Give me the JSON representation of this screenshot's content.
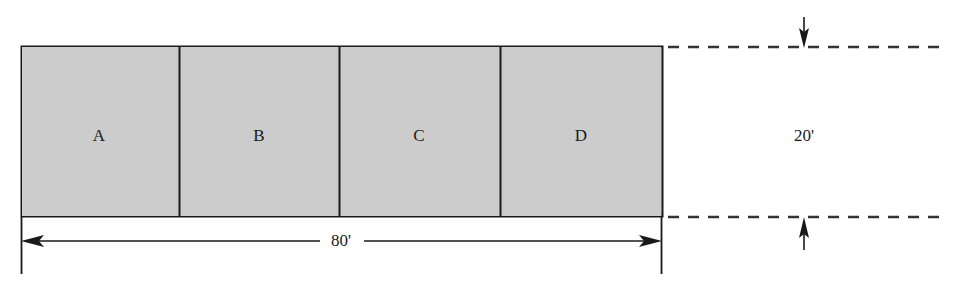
{
  "diagram": {
    "type": "engineering-dimension-diagram",
    "colors": {
      "fill": "#cccccc",
      "stroke": "#1a1a1a",
      "background": "#ffffff",
      "dashed": "#333333"
    },
    "main_shape": {
      "name": "lot-rectangle",
      "x": 21,
      "y": 46,
      "width": 641,
      "height": 170
    },
    "parcels": [
      {
        "id": "A",
        "label": "A",
        "x": 21,
        "width": 158,
        "center_x": 99
      },
      {
        "id": "B",
        "label": "B",
        "x": 179,
        "width": 160,
        "center_x": 259
      },
      {
        "id": "C",
        "label": "C",
        "x": 339,
        "width": 161,
        "center_x": 419
      },
      {
        "id": "D",
        "label": "D",
        "x": 500,
        "width": 162,
        "center_x": 581
      }
    ],
    "dividers": [
      179,
      339,
      500
    ],
    "dimensions": [
      {
        "name": "overall-width",
        "label": "80'",
        "value": 80,
        "unit": "ft",
        "orientation": "horizontal",
        "label_x": 341,
        "label_y": 241,
        "line_y": 241,
        "start_x": 21,
        "end_x": 662
      },
      {
        "name": "overall-depth",
        "label": "20'",
        "value": 20,
        "unit": "ft",
        "orientation": "vertical",
        "label_x": 804,
        "label_y": 136,
        "line_x": 804,
        "top_y": 47,
        "bottom_y": 217
      }
    ],
    "extension_lines": [
      {
        "name": "left-extension-line",
        "x": 21,
        "y1": 217,
        "y2": 274
      },
      {
        "name": "right-extension-line",
        "x": 662,
        "y1": 217,
        "y2": 274
      }
    ],
    "projection_lines": [
      {
        "name": "top-projection-line",
        "y": 47,
        "x1": 668,
        "x2": 945
      },
      {
        "name": "bottom-projection-line",
        "y": 217,
        "x1": 668,
        "x2": 945
      }
    ]
  }
}
